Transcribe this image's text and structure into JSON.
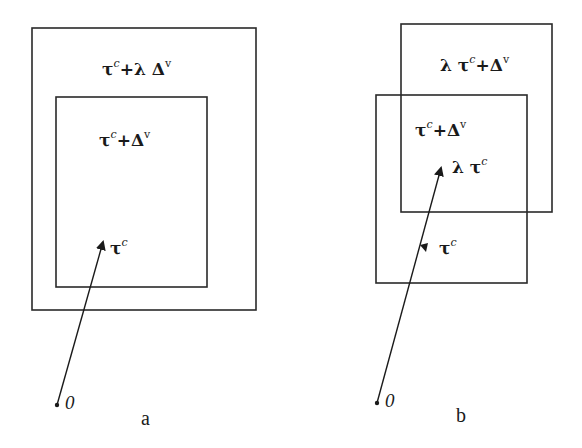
{
  "figure_a": {
    "caption": "a",
    "outer_box_label": {
      "tau": "τ",
      "tau_sup": "c",
      "plus": "+",
      "lambda": "λ ",
      "delta": "Δ",
      "delta_sup": "v"
    },
    "inner_box_label": {
      "tau": "τ",
      "tau_sup": "c",
      "plus": "+",
      "delta": "Δ",
      "delta_sup": "v"
    },
    "vector_label": {
      "tau": "τ",
      "tau_sup": "c"
    },
    "origin_label": "0"
  },
  "figure_b": {
    "caption": "b",
    "upper_box_label": {
      "lambda": "λ ",
      "tau": "τ",
      "tau_sup": "c",
      "plus": "+",
      "delta": "Δ",
      "delta_sup": "v"
    },
    "lower_box_label": {
      "tau": "τ",
      "tau_sup": "c",
      "plus": "+",
      "delta": "Δ",
      "delta_sup": "v"
    },
    "scaled_vector_label": {
      "lambda": "λ ",
      "tau": "τ",
      "tau_sup": "c"
    },
    "vector_label": {
      "tau": "τ",
      "tau_sup": "c"
    },
    "origin_label": "0"
  }
}
